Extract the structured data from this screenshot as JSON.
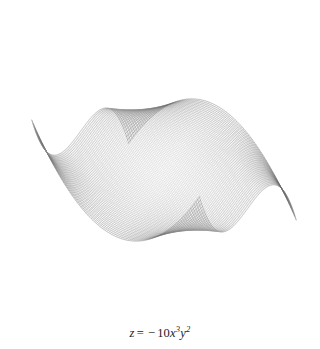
{
  "figure": {
    "background_color": "#ffffff",
    "width": 320,
    "height": 349,
    "plot_height": 320
  },
  "caption": {
    "full_text": "z = −10x³y²",
    "lhs": "z",
    "equals": "=",
    "minus": "−",
    "coefficient": "10",
    "var_x": "x",
    "exp_x": "3",
    "var_y": "y",
    "exp_y": "2"
  },
  "chart_data": {
    "type": "line",
    "render": "wireframe-surface-mesh",
    "title": "",
    "subtitle": "",
    "xlabel": "",
    "ylabel": "",
    "zlabel": "z",
    "annotations": [
      "z = −10x³y²"
    ],
    "legend": [],
    "legend_position": "none",
    "grid": false,
    "axes_visible": false,
    "surface_equation": "z = -10 * x^3 * y^2",
    "coefficient": -10,
    "x_exponent": 3,
    "y_exponent": 2,
    "xlim": [
      -1,
      1
    ],
    "ylim": [
      -1,
      1
    ],
    "zlim": [
      -10,
      10
    ],
    "mesh_lines_u": 96,
    "mesh_lines_v": 96,
    "line_color": "#000000",
    "line_width": 0.35,
    "projection": {
      "type": "oblique-isometric",
      "azimuth_deg": -60,
      "elevation_deg": 30,
      "center_px": [
        164,
        170
      ],
      "scale_x_px": 118,
      "scale_y_px": 118,
      "scale_z_px": 9.0
    },
    "feature_points_px": {
      "top_spike_apex": [
        135,
        25
      ],
      "bottom_spike_apex": [
        196,
        318
      ],
      "left_spike_tip": [
        22,
        92
      ],
      "right_spike_tip": [
        306,
        248
      ],
      "center_ridge_y": 163
    },
    "shading": {
      "min_gray": "#ffffff",
      "mid_gray": "#808080",
      "max_gray": "#000000",
      "dark_regions": [
        "left-fold-crease",
        "right-fold-crease"
      ]
    }
  }
}
